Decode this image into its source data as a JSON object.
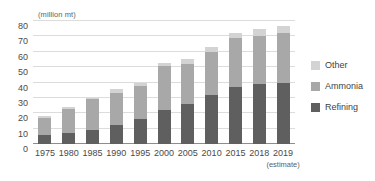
{
  "chart_data": {
    "type": "bar",
    "stacked": true,
    "title": "",
    "subtitle": "",
    "xlabel": "",
    "ylabel": "(million mt)",
    "unit_label": "(million mt)",
    "grid": true,
    "legend_position": "right",
    "ylim": [
      0,
      80
    ],
    "yticks": [
      80,
      70,
      60,
      50,
      40,
      30,
      20,
      10,
      0
    ],
    "categories": [
      "1975",
      "1980",
      "1985",
      "1990",
      "1995",
      "2000",
      "2005",
      "2010",
      "2015",
      "2018",
      "2019"
    ],
    "category_sublabels": [
      "",
      "",
      "",
      "",
      "",
      "",
      "",
      "",
      "",
      "",
      "(estimate)"
    ],
    "series": [
      {
        "name": "Refining",
        "color": "#5f5f5f",
        "values": [
          6,
          7,
          9,
          12.5,
          16.5,
          22,
          26,
          32,
          37,
          39,
          40
        ]
      },
      {
        "name": "Ammonia",
        "color": "#a8a8a8",
        "values": [
          11,
          16,
          20,
          21,
          21,
          29,
          26,
          28,
          32,
          31,
          32
        ]
      },
      {
        "name": "Other",
        "color": "#d3d3d3",
        "values": [
          1,
          1,
          1,
          2,
          2,
          2,
          3,
          3,
          3,
          5,
          5
        ]
      }
    ],
    "totals": [
      18,
      24,
      30,
      35.5,
      39.5,
      53,
      55,
      63,
      72,
      75,
      77
    ]
  },
  "legend": {
    "items": [
      {
        "label": "Other",
        "color": "#d3d3d3"
      },
      {
        "label": "Ammonia",
        "color": "#a8a8a8"
      },
      {
        "label": "Refining",
        "color": "#5f5f5f"
      }
    ]
  }
}
